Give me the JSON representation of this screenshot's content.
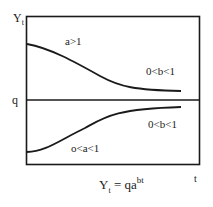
{
  "diagram": {
    "type": "exponential-growth-curve",
    "y_axis_label": {
      "main": "Y",
      "sub": "t"
    },
    "x_axis_label": "t",
    "asymptote_label": "q",
    "formula": {
      "lhs_main": "Y",
      "lhs_sub": "t",
      "eq": " = qa",
      "exponent": "bt"
    },
    "upper_region": {
      "param_a_label": "a>1",
      "param_b_label": "0<b<1"
    },
    "lower_region": {
      "param_a_label": "o<a<1",
      "param_b_label": "0<b<1"
    },
    "colors": {
      "line": "#1a1a1a",
      "background": "#ffffff"
    },
    "curves": {
      "upper": "M27,44 C50,48 75,62 100,76 C120,87 135,90 181,91",
      "lower": "M27,152 C45,152 60,140 85,128 C105,117 115,109 181,107"
    }
  }
}
